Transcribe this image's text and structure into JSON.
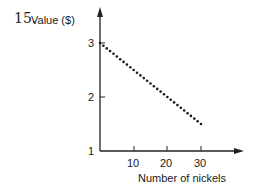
{
  "problem": {
    "number": "15."
  },
  "chart_data": {
    "type": "scatter",
    "title": "",
    "xlabel": "Number of nickels",
    "ylabel": "Value ($)",
    "x_ticks": [
      "10",
      "20",
      "30"
    ],
    "y_ticks": [
      "1",
      "2",
      "3"
    ],
    "xlim": [
      0,
      38
    ],
    "ylim": [
      1,
      3.6
    ],
    "grid": false,
    "legend": null,
    "series": [
      {
        "name": "Value vs nickels",
        "style": "dotted",
        "x": [
          0,
          1,
          2,
          3,
          4,
          5,
          6,
          7,
          8,
          9,
          10,
          11,
          12,
          13,
          14,
          15,
          16,
          17,
          18,
          19,
          20,
          21,
          22,
          23,
          24,
          25,
          26,
          27,
          28,
          29,
          30
        ],
        "y": [
          3.0,
          2.95,
          2.9,
          2.85,
          2.8,
          2.75,
          2.7,
          2.65,
          2.6,
          2.55,
          2.5,
          2.45,
          2.4,
          2.35,
          2.3,
          2.25,
          2.2,
          2.15,
          2.1,
          2.05,
          2.0,
          1.95,
          1.9,
          1.85,
          1.8,
          1.75,
          1.7,
          1.65,
          1.6,
          1.55,
          1.5
        ]
      }
    ]
  }
}
